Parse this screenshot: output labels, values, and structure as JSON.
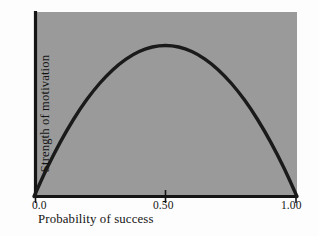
{
  "chart_data": {
    "type": "line",
    "title": "",
    "subtitle": "",
    "xlabel": "Probability of success",
    "ylabel": "Strength of motivation",
    "xlim": [
      0.0,
      1.0
    ],
    "ylim": [
      0.0,
      1.0
    ],
    "grid": false,
    "legend": null,
    "plot_background_color": "#9a9a9a",
    "line_color": "#1a1a1a",
    "axis_color": "#151515",
    "xticks": [
      {
        "value": 0.0,
        "label": "0.0"
      },
      {
        "value": 0.5,
        "label": "0.50"
      },
      {
        "value": 1.0,
        "label": "1.00"
      }
    ],
    "yticks": [],
    "annotations": [],
    "series": [
      {
        "name": "Strength of motivation",
        "x": [
          0.0,
          0.05,
          0.1,
          0.15,
          0.2,
          0.25,
          0.3,
          0.35,
          0.4,
          0.45,
          0.5,
          0.55,
          0.6,
          0.65,
          0.7,
          0.75,
          0.8,
          0.85,
          0.9,
          0.95,
          1.0
        ],
        "y": [
          0.0,
          0.19,
          0.36,
          0.51,
          0.64,
          0.75,
          0.84,
          0.91,
          0.96,
          0.99,
          1.0,
          0.99,
          0.96,
          0.91,
          0.84,
          0.75,
          0.64,
          0.51,
          0.36,
          0.19,
          0.0
        ]
      }
    ]
  }
}
